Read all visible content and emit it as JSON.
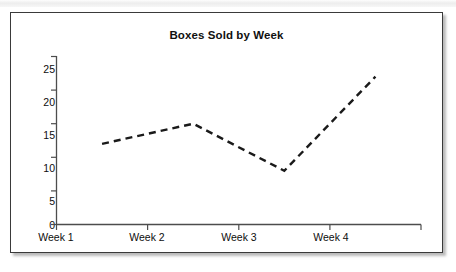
{
  "chart_data": {
    "type": "line",
    "title": "Boxes Sold by Week",
    "xlabel": "",
    "ylabel": "",
    "categories": [
      "Week 1",
      "Week 2",
      "Week 3",
      "Week 4"
    ],
    "values": [
      12,
      15,
      8,
      22
    ],
    "series": [
      {
        "name": "Boxes Sold",
        "values": [
          12,
          15,
          8,
          22
        ]
      }
    ],
    "ylim": [
      0,
      25
    ],
    "yticks": [
      0,
      5,
      10,
      15,
      20,
      25
    ],
    "ytick_labels": [
      "0",
      "5",
      "10",
      "15",
      "20",
      "25"
    ],
    "xtick_labels": [
      "Week 1",
      "Week 2",
      "Week 3",
      "Week 4"
    ],
    "grid": false,
    "legend": false,
    "legend_position": "none",
    "line_style": "dashed",
    "line_color": "#1a1a1a",
    "markers": false,
    "axis_color": "#4d4d4d",
    "background_color": "#ffffff",
    "frame_border_color": "#3a3a3a"
  },
  "figure": {
    "title": "Boxes Sold by Week"
  }
}
